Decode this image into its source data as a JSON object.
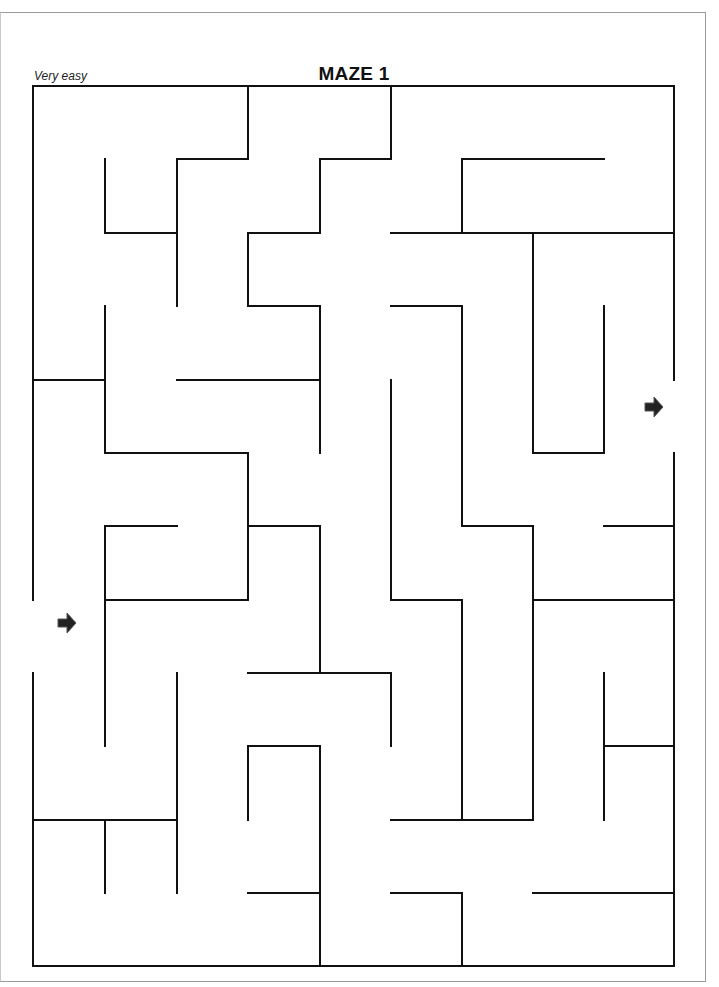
{
  "worksheet": {
    "title": "MAZE 1",
    "difficulty": "Very easy"
  },
  "maze": {
    "columns": 9,
    "rows": 12,
    "col_x": [
      33,
      105,
      177,
      248,
      320,
      391,
      462,
      533,
      604,
      674
    ],
    "row_y": [
      86,
      159,
      233,
      306,
      380,
      453,
      526,
      600,
      673,
      746,
      820,
      893,
      966
    ],
    "wall_color": "#111111",
    "entrance": {
      "side": "left",
      "row": 7,
      "icon": "arrow-right-icon"
    },
    "exit": {
      "side": "right",
      "row": 4,
      "icon": "arrow-right-icon"
    },
    "walls": [
      [
        0,
        0,
        9,
        0
      ],
      [
        0,
        0,
        0,
        7
      ],
      [
        0,
        8,
        0,
        12
      ],
      [
        0,
        12,
        9,
        12
      ],
      [
        9,
        0,
        9,
        4
      ],
      [
        9,
        5,
        9,
        12
      ],
      [
        3,
        0,
        3,
        1
      ],
      [
        2,
        1,
        3,
        1
      ],
      [
        2,
        1,
        2,
        3
      ],
      [
        1,
        1,
        1,
        2
      ],
      [
        1,
        2,
        2,
        2
      ],
      [
        3,
        2,
        4,
        2
      ],
      [
        3,
        2,
        3,
        3
      ],
      [
        3,
        3,
        4,
        3
      ],
      [
        4,
        1,
        4,
        2
      ],
      [
        4,
        1,
        5,
        1
      ],
      [
        5,
        0,
        5,
        1
      ],
      [
        6,
        1,
        8,
        1
      ],
      [
        6,
        1,
        6,
        2
      ],
      [
        5,
        2,
        9,
        2
      ],
      [
        7,
        2,
        7,
        5
      ],
      [
        7,
        5,
        8,
        5
      ],
      [
        8,
        3,
        8,
        5
      ],
      [
        5,
        3,
        6,
        3
      ],
      [
        6,
        3,
        6,
        6
      ],
      [
        1,
        3,
        1,
        5
      ],
      [
        0,
        4,
        1,
        4
      ],
      [
        2,
        4,
        4,
        4
      ],
      [
        4,
        3,
        4,
        5
      ],
      [
        1,
        5,
        3,
        5
      ],
      [
        3,
        5,
        3,
        7
      ],
      [
        1,
        6,
        2,
        6
      ],
      [
        1,
        6,
        1,
        9
      ],
      [
        1,
        7,
        3,
        7
      ],
      [
        3,
        6,
        4,
        6
      ],
      [
        4,
        6,
        4,
        8
      ],
      [
        5,
        4,
        5,
        7
      ],
      [
        5,
        7,
        6,
        7
      ],
      [
        6,
        7,
        6,
        10
      ],
      [
        6,
        6,
        7,
        6
      ],
      [
        7,
        6,
        7,
        10
      ],
      [
        8,
        6,
        9,
        6
      ],
      [
        7,
        7,
        9,
        7
      ],
      [
        3,
        8,
        5,
        8
      ],
      [
        5,
        8,
        5,
        9
      ],
      [
        2,
        8,
        2,
        11
      ],
      [
        0,
        10,
        2,
        10
      ],
      [
        1,
        10,
        1,
        11
      ],
      [
        3,
        9,
        4,
        9
      ],
      [
        3,
        9,
        3,
        10
      ],
      [
        4,
        9,
        4,
        12
      ],
      [
        3,
        11,
        4,
        11
      ],
      [
        5,
        10,
        7,
        10
      ],
      [
        5,
        11,
        6,
        11
      ],
      [
        6,
        11,
        6,
        12
      ],
      [
        7,
        11,
        9,
        11
      ],
      [
        8,
        8,
        8,
        10
      ],
      [
        8,
        9,
        9,
        9
      ]
    ]
  }
}
